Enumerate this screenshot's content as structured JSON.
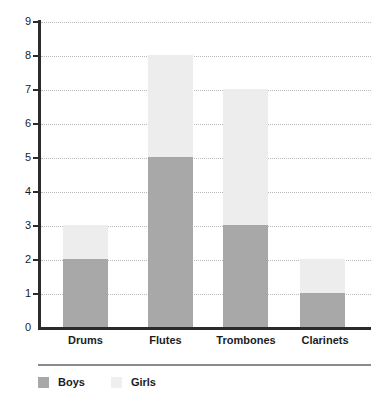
{
  "chart_data": {
    "type": "bar",
    "subtype": "stacked-bar",
    "title": "",
    "xlabel": "",
    "ylabel": "",
    "categories": [
      "Drums",
      "Flutes",
      "Trombones",
      "Clarinets"
    ],
    "series": [
      {
        "name": "Boys",
        "values": [
          2,
          5,
          3,
          1
        ],
        "color": "#a8a8a8"
      },
      {
        "name": "Girls",
        "values": [
          1,
          3,
          4,
          1
        ],
        "color": "#ededed"
      }
    ],
    "totals": [
      3,
      8,
      7,
      2
    ],
    "ylim": [
      0,
      9
    ],
    "ytick_step": 1,
    "ytick_labels": [
      "0",
      "1",
      "2",
      "3",
      "4",
      "5",
      "6",
      "7",
      "8",
      "9"
    ],
    "grid": true,
    "grid_style": "dotted",
    "grid_color": "#b9b9b9",
    "axis_color": "#2b2b2b",
    "legend_position": "bottom-left",
    "legend_entries": [
      {
        "label": "Boys",
        "color": "#a8a8a8"
      },
      {
        "label": "Girls",
        "color": "#ededed"
      }
    ],
    "background": "#ffffff"
  }
}
